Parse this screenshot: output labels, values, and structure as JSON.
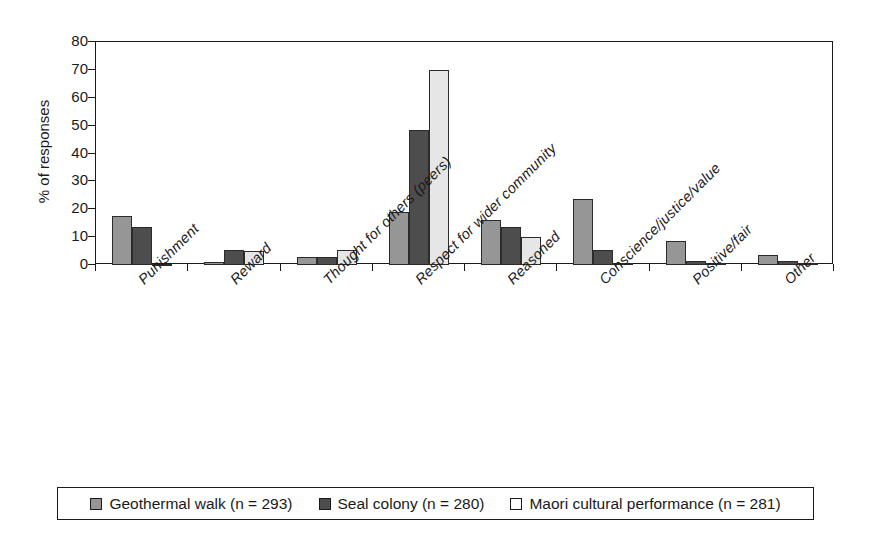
{
  "chart_data": {
    "type": "bar",
    "title": "",
    "xlabel": "",
    "ylabel": "% of responses",
    "ylim": [
      0,
      80
    ],
    "yticks": [
      0,
      10,
      20,
      30,
      40,
      50,
      60,
      70,
      80
    ],
    "grid": false,
    "legend_position": "bottom",
    "categories": [
      "Punishment",
      "Reward",
      "Thought for others (peers)",
      "Respect for wider community",
      "Reasoned",
      "Conscience/justice/value",
      "Positive/fair",
      "Other"
    ],
    "series": [
      {
        "name": "Geothermal walk (n = 293)",
        "color": "#969696",
        "values": [
          17.5,
          1.0,
          3.0,
          19.0,
          16.0,
          23.5,
          8.5,
          3.5
        ]
      },
      {
        "name": "Seal colony (n = 280)",
        "color": "#4d4d4d",
        "values": [
          13.5,
          5.5,
          3.0,
          48.5,
          13.5,
          5.5,
          1.5,
          1.5
        ]
      },
      {
        "name": "Maori cultural performance (n = 281)",
        "color": "#e6e6e6",
        "values": [
          0.5,
          5.0,
          5.5,
          70.0,
          10.0,
          0.8,
          0.8,
          0.8
        ]
      }
    ]
  },
  "legend": {
    "entries": [
      {
        "label": "Geothermal walk (n = 293)"
      },
      {
        "label": "Seal colony (n = 280)"
      },
      {
        "label": "Maori cultural performance (n = 281)"
      }
    ]
  },
  "axis": {
    "y_title": "% of responses",
    "y_tick_labels": [
      "80",
      "70",
      "60",
      "50",
      "40",
      "30",
      "20",
      "10",
      "0"
    ]
  }
}
